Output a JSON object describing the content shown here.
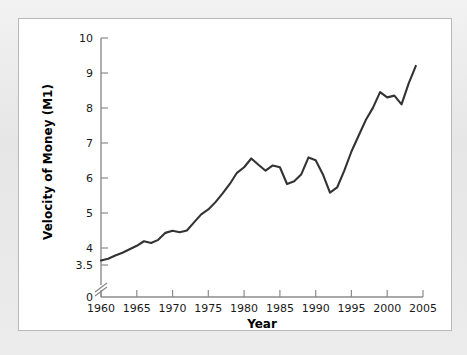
{
  "figure": {
    "panel_background": "#ffffff",
    "frame_background": "#ececec",
    "line_color": "#333333"
  },
  "chart_data": {
    "type": "line",
    "title": "",
    "subtitle": "",
    "xlabel": "Year",
    "ylabel": "Velocity of Money (M1)",
    "xlim": [
      1960,
      2005
    ],
    "ylim": [
      3.5,
      10
    ],
    "y_axis_break": true,
    "y_axis_break_note": "axis broken between 0 and 3.5",
    "grid": false,
    "legend": "none",
    "xticks": [
      1960,
      1965,
      1970,
      1975,
      1980,
      1985,
      1990,
      1995,
      2000,
      2005
    ],
    "xtick_labels": [
      "1960",
      "1965",
      "1970",
      "1975",
      "1980",
      "1985",
      "1990",
      "1995",
      "2000",
      "2005"
    ],
    "yticks": [
      0,
      3.5,
      4,
      5,
      6,
      7,
      8,
      9,
      10
    ],
    "ytick_labels": [
      "0",
      "3.5",
      "4",
      "5",
      "6",
      "7",
      "8",
      "9",
      "10"
    ],
    "series": [
      {
        "name": "Velocity of Money (M1)",
        "color": "#333333",
        "x": [
          1960,
          1961,
          1962,
          1963,
          1964,
          1965,
          1966,
          1967,
          1968,
          1969,
          1970,
          1971,
          1972,
          1973,
          1974,
          1975,
          1976,
          1977,
          1978,
          1979,
          1980,
          1981,
          1982,
          1983,
          1984,
          1985,
          1986,
          1987,
          1988,
          1989,
          1990,
          1991,
          1992,
          1993,
          1994,
          1995,
          1996,
          1997,
          1998,
          1999,
          2000,
          2001,
          2002,
          2003,
          2004
        ],
        "values": [
          3.63,
          3.68,
          3.77,
          3.85,
          3.95,
          4.05,
          4.18,
          4.13,
          4.22,
          4.42,
          4.48,
          4.44,
          4.49,
          4.72,
          4.95,
          5.09,
          5.3,
          5.55,
          5.82,
          6.14,
          6.3,
          6.55,
          6.37,
          6.2,
          6.35,
          6.3,
          5.82,
          5.9,
          6.1,
          6.58,
          6.5,
          6.1,
          5.57,
          5.72,
          6.2,
          6.75,
          7.2,
          7.65,
          8.0,
          8.45,
          8.3,
          8.35,
          8.1,
          8.7,
          9.2
        ]
      }
    ]
  },
  "axes": {
    "x_axis_name": "year-axis",
    "y_axis_name": "velocity-axis"
  }
}
